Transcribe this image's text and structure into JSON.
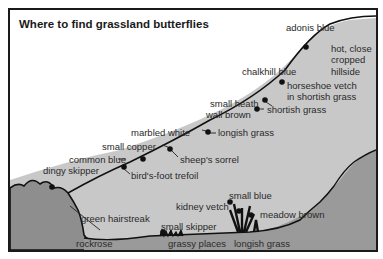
{
  "title": "Where to find grassland butterflies",
  "colors": {
    "hill_fill": "#c4c4c4",
    "rock_fill": "#8a8a8a",
    "outline": "#111111",
    "background": "#ffffff"
  },
  "butterflies": [
    {
      "name": "adonis blue",
      "habitat": "hot, close cropped hillside"
    },
    {
      "name": "chalkhill blue",
      "habitat": "horseshoe vetch in shortish grass"
    },
    {
      "name": "small heath",
      "habitat": "shortish grass"
    },
    {
      "name": "wall brown",
      "habitat": "shortish grass"
    },
    {
      "name": "marbled white",
      "habitat": "longish grass"
    },
    {
      "name": "small copper",
      "habitat": "sheep's sorrel"
    },
    {
      "name": "common blue",
      "habitat": "bird's-foot trefoil"
    },
    {
      "name": "dingy skipper",
      "habitat": ""
    },
    {
      "name": "green hairstreak",
      "habitat": "rockrose"
    },
    {
      "name": "small skipper",
      "habitat": "grassy places"
    },
    {
      "name": "small blue",
      "habitat": "kidney vetch"
    },
    {
      "name": "meadow brown",
      "habitat": "longish grass"
    }
  ],
  "labels": {
    "adonis_blue": "adonis blue",
    "hot_close": "hot, close",
    "cropped": "cropped",
    "hillside": "hillside",
    "chalkhill_blue": "chalkhill blue",
    "horseshoe_vetch": "horseshoe vetch",
    "in_shortish_grass": "in shortish grass",
    "small_heath": "small heath",
    "wall_brown": "wall brown",
    "shortish_grass": "shortish grass",
    "marbled_white": "marbled white",
    "longish_grass_upper": "longish grass",
    "small_copper": "small copper",
    "sheeps_sorrel": "sheep's sorrel",
    "common_blue": "common blue",
    "birds_foot_trefoil": "bird's-foot trefoil",
    "dingy_skipper": "dingy skipper",
    "green_hairstreak": "green hairstreak",
    "rockrose": "rockrose",
    "small_skipper": "small skipper",
    "grassy_places": "grassy places",
    "kidney_vetch": "kidney vetch",
    "small_blue": "small blue",
    "meadow_brown": "meadow brown",
    "longish_grass_lower": "longish grass"
  }
}
